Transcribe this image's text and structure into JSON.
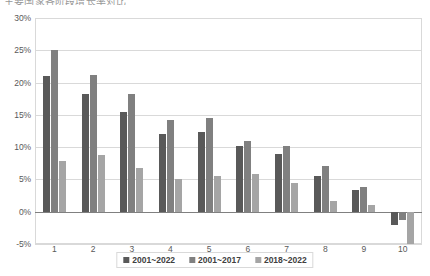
{
  "chart_data": {
    "type": "bar",
    "title": "主要国家各阶段增长率对比",
    "xlabel": "",
    "ylabel": "",
    "ylim": [
      -5,
      30
    ],
    "ytick_labels": [
      "30%",
      "25%",
      "20%",
      "15%",
      "10%",
      "5%",
      "0%",
      "-5%"
    ],
    "ytick_values": [
      30,
      25,
      20,
      15,
      10,
      5,
      0,
      -5
    ],
    "grid": true,
    "legend_position": "bottom",
    "categories": [
      "1",
      "2",
      "3",
      "4",
      "5",
      "6",
      "7",
      "8",
      "9",
      "10"
    ],
    "series": [
      {
        "name": "2001~2022",
        "color": "#595959",
        "values": [
          21.0,
          18.2,
          15.5,
          12.1,
          12.3,
          10.1,
          8.9,
          5.6,
          3.3,
          -2.0
        ]
      },
      {
        "name": "2001~2017",
        "color": "#808080",
        "values": [
          25.0,
          21.2,
          18.2,
          14.2,
          14.5,
          11.0,
          10.2,
          7.1,
          3.8,
          -1.3
        ]
      },
      {
        "name": "2018~2022",
        "color": "#a5a5a5",
        "values": [
          7.9,
          8.8,
          6.8,
          5.1,
          5.6,
          5.9,
          4.5,
          1.7,
          1.1,
          -5.0
        ]
      }
    ]
  }
}
